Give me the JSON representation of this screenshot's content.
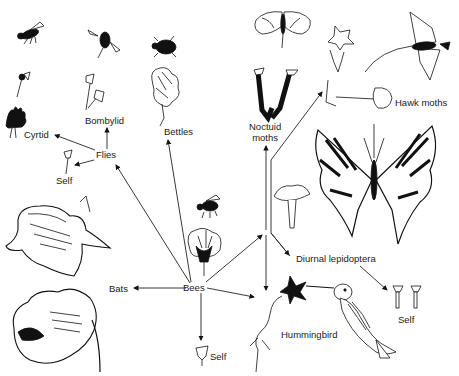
{
  "diagram": {
    "center_node": "Bees",
    "nodes": [
      {
        "id": "bees",
        "label": "Bees"
      },
      {
        "id": "flies",
        "label": "Flies"
      },
      {
        "id": "cyrtid",
        "label": "Cyrtid"
      },
      {
        "id": "bombylid",
        "label": "Bombylid"
      },
      {
        "id": "self_flies",
        "label": "Self"
      },
      {
        "id": "bettles",
        "label": "Bettles"
      },
      {
        "id": "noctuid",
        "label": "Noctuid\nmoths"
      },
      {
        "id": "hawk",
        "label": "Hawk moths"
      },
      {
        "id": "diurnal",
        "label": "Diurnal lepidoptera"
      },
      {
        "id": "self_diurnal",
        "label": "Self"
      },
      {
        "id": "hummingbird",
        "label": "Hummingbird"
      },
      {
        "id": "bats",
        "label": "Bats"
      },
      {
        "id": "self_bees",
        "label": "Self"
      }
    ],
    "edges": [
      {
        "from": "Bees",
        "to": "Flies"
      },
      {
        "from": "Flies",
        "to": "Cyrtid"
      },
      {
        "from": "Flies",
        "to": "Bombylid"
      },
      {
        "from": "Flies",
        "to": "Self"
      },
      {
        "from": "Bees",
        "to": "Bettles"
      },
      {
        "from": "Bees",
        "to": "Noctuid moths"
      },
      {
        "from": "Bees",
        "to": "Hawk moths"
      },
      {
        "from": "Bees",
        "to": "Diurnal lepidoptera"
      },
      {
        "from": "Diurnal lepidoptera",
        "to": "Self"
      },
      {
        "from": "Bees",
        "to": "Hummingbird"
      },
      {
        "from": "Bees",
        "to": "Bats"
      },
      {
        "from": "Bees",
        "to": "Self"
      }
    ],
    "labels": {
      "bees": "Bees",
      "flies": "Flies",
      "cyrtid": "Cyrtid",
      "bombylid": "Bombylid",
      "self_flies": "Self",
      "bettles": "Bettles",
      "noctuid_line1": "Noctuid",
      "noctuid_line2": "moths",
      "hawk": "Hawk moths",
      "diurnal": "Diurnal lepidoptera",
      "self_diurnal": "Self",
      "hummingbird": "Hummingbird",
      "bats": "Bats",
      "self_bees": "Self"
    },
    "illustrations": [
      "fly-insect",
      "cyrtid-flower",
      "cyrtid-flower-head",
      "bombylid-fly",
      "bombylid-flowers",
      "beetle",
      "beetle-flower",
      "noctuid-moth",
      "noctuid-flowers",
      "hawk-moth",
      "hawk-moth-flower",
      "swallowtail-butterfly",
      "butterfly-flower",
      "bee",
      "bee-flower",
      "bat-flower-upper",
      "bat-flower-lower",
      "hummingbird",
      "hummingbird-flower",
      "self-flowers-flies",
      "self-flower-bees",
      "self-flowers-diurnal"
    ],
    "colors": {
      "ink": "#111111",
      "background": "#ffffff"
    }
  }
}
